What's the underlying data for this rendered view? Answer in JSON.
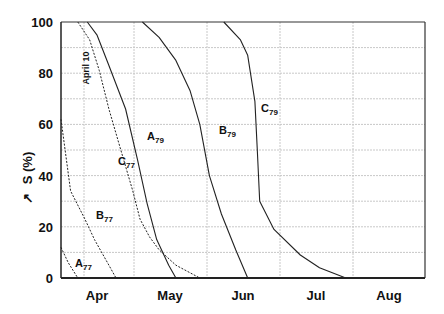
{
  "chart_data": {
    "type": "line",
    "title": "",
    "xlabel": "",
    "ylabel": "S (%)",
    "ylim": [
      0,
      100
    ],
    "yticks": [
      0,
      20,
      40,
      60,
      80,
      100
    ],
    "ytick_labels": [
      "0",
      "20",
      "40",
      "60",
      "80",
      "100"
    ],
    "x_unit": "days since April 1",
    "xlim": [
      0,
      152
    ],
    "x_categories": [
      "Apr",
      "May",
      "Jun",
      "Jul",
      "Aug"
    ],
    "grid": true,
    "legend": "none (curves labeled inline)",
    "annotations": [
      {
        "text": "April 10",
        "x": 9,
        "orientation": "vertical"
      }
    ],
    "series": [
      {
        "name": "A77",
        "label_main": "A",
        "label_sub": "77",
        "style": "dashed",
        "x": [
          0,
          3,
          7
        ],
        "y": [
          12,
          6,
          0
        ]
      },
      {
        "name": "B77",
        "label_main": "B",
        "label_sub": "77",
        "style": "dashed",
        "x": [
          0,
          4,
          10,
          14,
          20,
          23
        ],
        "y": [
          62,
          34,
          23,
          15,
          5,
          0
        ]
      },
      {
        "name": "C77",
        "label_main": "C",
        "label_sub": "77",
        "style": "dashed",
        "x": [
          7,
          12,
          16,
          20,
          25,
          30,
          33,
          37,
          41,
          48,
          58
        ],
        "y": [
          100,
          93,
          81,
          66,
          50,
          34,
          23,
          16,
          11,
          5,
          0
        ]
      },
      {
        "name": "A79",
        "label_main": "A",
        "label_sub": "79",
        "style": "solid",
        "x": [
          11,
          15,
          20,
          27,
          32,
          36,
          40,
          45,
          48
        ],
        "y": [
          100,
          95,
          83,
          66,
          46,
          29,
          15,
          5,
          0
        ]
      },
      {
        "name": "B79",
        "label_main": "B",
        "label_sub": "79",
        "style": "solid",
        "x": [
          34,
          41,
          48,
          54,
          58,
          62,
          67,
          73,
          78
        ],
        "y": [
          100,
          94,
          85,
          73,
          60,
          40,
          25,
          11,
          0
        ]
      },
      {
        "name": "C79",
        "label_main": "C",
        "label_sub": "79",
        "style": "solid",
        "x": [
          68,
          75,
          78,
          81,
          82,
          83,
          89,
          100,
          108,
          119
        ],
        "y": [
          100,
          93,
          87,
          69,
          50,
          30,
          19,
          9,
          4,
          0
        ]
      }
    ]
  },
  "axes": {
    "y_label": "S (%)",
    "y_prefix_symbol": "↗",
    "annotation": "April 10"
  },
  "labels": {
    "A77": {
      "main": "A",
      "sub": "77"
    },
    "B77": {
      "main": "B",
      "sub": "77"
    },
    "C77": {
      "main": "C",
      "sub": "77"
    },
    "A79": {
      "main": "A",
      "sub": "79"
    },
    "B79": {
      "main": "B",
      "sub": "79"
    },
    "C79": {
      "main": "C",
      "sub": "79"
    }
  }
}
